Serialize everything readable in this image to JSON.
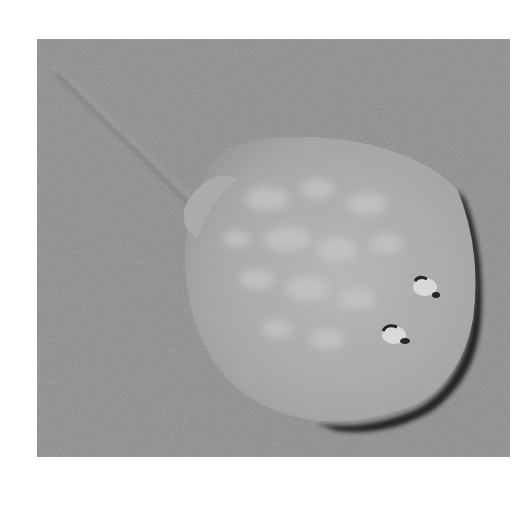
{
  "image": {
    "subject": "stingray resting on sandy seabed",
    "alt": "Black-and-white photograph of a round stingray with a long thin tail lying on sand, viewed from above",
    "colors": {
      "background": "#ffffff",
      "sand": "#9a9a9a",
      "ray_body": "#b4b4b4",
      "ray_spots": "#c8c8c8",
      "shadow": "#1e1e1e"
    }
  }
}
